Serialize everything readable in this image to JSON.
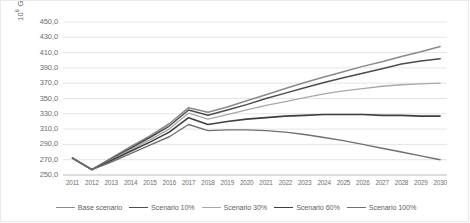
{
  "chart_data": {
    "type": "line",
    "title": "",
    "xlabel": "",
    "ylabel": "10⁶ Gigajoule",
    "ylabel_base": "10",
    "ylabel_exp": "6",
    "ylabel_unit": " Gigajoule",
    "ylim": [
      250.0,
      450.0
    ],
    "ystep": 20,
    "grid": true,
    "legend_position": "bottom",
    "x": [
      2011,
      2012,
      2013,
      2014,
      2015,
      2016,
      2017,
      2018,
      2019,
      2020,
      2021,
      2022,
      2023,
      2024,
      2025,
      2026,
      2027,
      2028,
      2029,
      2030
    ],
    "ytick_labels": [
      "450,0",
      "430,0",
      "410,0",
      "390,0",
      "370,0",
      "350,0",
      "330,0",
      "310,0",
      "290,0",
      "270,0",
      "250,0"
    ],
    "ytick_values": [
      450.0,
      430.0,
      410.0,
      390.0,
      370.0,
      350.0,
      330.0,
      310.0,
      290.0,
      270.0,
      250.0
    ],
    "xtick_labels": [
      "2011",
      "2012",
      "2013",
      "2014",
      "2015",
      "2016",
      "2017",
      "2018",
      "2019",
      "2020",
      "2021",
      "2022",
      "2023",
      "2024",
      "2025",
      "2026",
      "2027",
      "2028",
      "2029",
      "2030"
    ],
    "series": [
      {
        "name": "Base scenario",
        "color": "#8a8a8a",
        "width": 1.5,
        "values": [
          272.0,
          257.0,
          272.0,
          287.0,
          301.0,
          317.0,
          338.0,
          332.0,
          339.0,
          347.0,
          355.0,
          363.0,
          371.0,
          378.0,
          385.0,
          392.0,
          398.0,
          405.0,
          411.0,
          418.0
        ]
      },
      {
        "name": "Scenario 10%",
        "color": "#4d4d4d",
        "width": 1.5,
        "values": [
          272.0,
          257.0,
          271.0,
          285.0,
          299.0,
          314.0,
          335.0,
          328.0,
          335.0,
          342.0,
          350.0,
          357.0,
          364.0,
          371.0,
          377.0,
          383.0,
          389.0,
          395.0,
          399.0,
          402.0
        ]
      },
      {
        "name": "Scenario 30%",
        "color": "#a8a8a8",
        "width": 1.3,
        "values": [
          272.0,
          257.0,
          270.0,
          283.0,
          296.0,
          310.0,
          331.0,
          323.0,
          329.0,
          335.0,
          341.0,
          346.0,
          351.0,
          356.0,
          360.0,
          363.0,
          366.0,
          368.0,
          369.0,
          370.0
        ]
      },
      {
        "name": "Scenario 60%",
        "color": "#3f3f3f",
        "width": 1.6,
        "values": [
          272.0,
          257.0,
          269.0,
          281.0,
          293.0,
          306.0,
          325.0,
          316.0,
          320.0,
          323.0,
          325.0,
          327.0,
          328.0,
          329.0,
          329.0,
          329.0,
          328.0,
          328.0,
          327.0,
          327.0
        ]
      },
      {
        "name": "Scenario 100%",
        "color": "#707070",
        "width": 1.4,
        "values": [
          272.0,
          257.0,
          267.0,
          278.0,
          289.0,
          300.0,
          316.0,
          308.0,
          309.0,
          309.0,
          308.0,
          306.0,
          303.0,
          299.0,
          295.0,
          290.0,
          285.0,
          280.0,
          275.0,
          270.0
        ]
      }
    ]
  }
}
